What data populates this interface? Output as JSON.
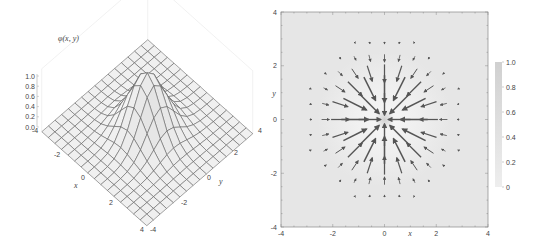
{
  "chart_data": [
    {
      "type": "surface3d",
      "title": "",
      "zlabel": "φ(x, y)",
      "function": "exp(-(x^2+y^2)/2)",
      "xlabel": "x",
      "ylabel": "y",
      "xlim": [
        -4,
        4
      ],
      "ylim": [
        -4,
        4
      ],
      "zlim": [
        0,
        1
      ],
      "x_ticks": [
        "-4",
        "-2",
        "0",
        "2",
        "4"
      ],
      "y_ticks": [
        "-4",
        "-2",
        "0",
        "2",
        "4"
      ],
      "z_ticks": [
        "0.0",
        "0.2",
        "0.4",
        "0.6",
        "0.8",
        "1.0"
      ],
      "mesh_divisions": 16,
      "peak": {
        "x": 0,
        "y": 0,
        "z": 1.0
      }
    },
    {
      "type": "vector_field_density",
      "title": "",
      "xlabel": "x",
      "ylabel": "y",
      "xlim": [
        -4,
        4
      ],
      "ylim": [
        -4,
        4
      ],
      "x_ticks": [
        "-4",
        "-2",
        "0",
        "2",
        "4"
      ],
      "y_ticks": [
        "-4",
        "-2",
        "0",
        "2",
        "4"
      ],
      "field": "gradient of exp(-(x^2+y^2)/2), arrows pointing toward origin",
      "arrow_spacing": 0.57,
      "colorbar": {
        "min": 0,
        "max": 1.0,
        "ticks": [
          "0",
          "0.2",
          "0.4",
          "0.6",
          "0.8",
          "1.0"
        ]
      },
      "colors": {
        "background_low": "#e6e6e6",
        "background_high": "#ffffff",
        "arrow": "#555555",
        "mesh": "#555555"
      }
    }
  ]
}
